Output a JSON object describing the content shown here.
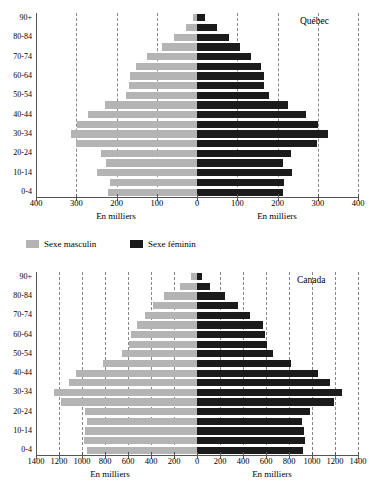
{
  "legend": {
    "items": [
      {
        "label": "Sexe masculin",
        "color": "#b4b4b4",
        "icon": "male-swatch"
      },
      {
        "label": "Sexe féminin",
        "color": "#1b1b1b",
        "icon": "female-swatch"
      }
    ]
  },
  "charts": [
    {
      "id": "quebec",
      "region_label": "Québec",
      "xlabel_left": "En milliers",
      "xlabel_right": "En milliers",
      "ticks": [
        "400",
        "300",
        "200",
        "100",
        "0",
        "100",
        "200",
        "300",
        "400"
      ],
      "age_labels_all": [
        "0-4",
        "5-9",
        "10-14",
        "15-19",
        "20-24",
        "25-29",
        "30-34",
        "35-39",
        "40-44",
        "45-49",
        "50-54",
        "55-59",
        "60-64",
        "65-69",
        "70-74",
        "75-79",
        "80-84",
        "85-89",
        "90+"
      ],
      "age_labels_shown": [
        "90+",
        "80-84",
        "70-74",
        "60-64",
        "50-54",
        "40-44",
        "30-34",
        "20-24",
        "10-14",
        "0-4"
      ],
      "chart_data": {
        "type": "bar",
        "subtype": "population-pyramid",
        "title": "Québec",
        "xlabel": "En milliers",
        "ylabel": "",
        "xlim": [
          -400,
          400
        ],
        "xticks": [
          -400,
          -300,
          -200,
          -100,
          0,
          100,
          200,
          300,
          400
        ],
        "xticklabels": [
          "400",
          "300",
          "200",
          "100",
          "0",
          "100",
          "200",
          "300",
          "400"
        ],
        "grid": true,
        "legend_position": "below-chart",
        "categories": [
          "0-4",
          "5-9",
          "10-14",
          "15-19",
          "20-24",
          "25-29",
          "30-34",
          "35-39",
          "40-44",
          "45-49",
          "50-54",
          "55-59",
          "60-64",
          "65-69",
          "70-74",
          "75-79",
          "80-84",
          "85-89",
          "90+"
        ],
        "series": [
          {
            "name": "Sexe masculin",
            "color": "#b4b4b4",
            "side": "left",
            "values": [
              222,
              217,
              249,
              227,
              239,
              300,
              312,
              297,
              270,
              228,
              176,
              168,
              166,
              152,
              123,
              88,
              56,
              28,
              9
            ]
          },
          {
            "name": "Sexe féminin",
            "color": "#1b1b1b",
            "side": "right",
            "values": [
              213,
              215,
              235,
              213,
              233,
              298,
              325,
              300,
              272,
              226,
              178,
              167,
              166,
              158,
              134,
              108,
              80,
              50,
              20
            ]
          }
        ]
      }
    },
    {
      "id": "canada",
      "region_label": "Canada",
      "xlabel_left": "En milliers",
      "xlabel_right": "En milliers",
      "ticks": [
        "1400",
        "1200",
        "1000",
        "800",
        "600",
        "400",
        "200",
        "0",
        "200",
        "400",
        "600",
        "800",
        "1000",
        "1200",
        "1400"
      ],
      "age_labels_all": [
        "0-4",
        "5-9",
        "10-14",
        "15-19",
        "20-24",
        "25-29",
        "30-34",
        "35-39",
        "40-44",
        "45-49",
        "50-54",
        "55-59",
        "60-64",
        "65-69",
        "70-74",
        "75-79",
        "80-84",
        "85-89",
        "90+"
      ],
      "age_labels_shown": [
        "90+",
        "80-84",
        "70-74",
        "60-64",
        "50-54",
        "40-44",
        "30-34",
        "20-24",
        "10-14",
        "0-4"
      ],
      "chart_data": {
        "type": "bar",
        "subtype": "population-pyramid",
        "title": "Canada",
        "xlabel": "En milliers",
        "ylabel": "",
        "xlim": [
          -1400,
          1400
        ],
        "xticks": [
          -1400,
          -1200,
          -1000,
          -800,
          -600,
          -400,
          -200,
          0,
          200,
          400,
          600,
          800,
          1000,
          1200,
          1400
        ],
        "xticklabels": [
          "1400",
          "1200",
          "1000",
          "800",
          "600",
          "400",
          "200",
          "0",
          "200",
          "400",
          "600",
          "800",
          "1000",
          "1200",
          "1400"
        ],
        "grid": true,
        "legend_position": "above-chart",
        "categories": [
          "0-4",
          "5-9",
          "10-14",
          "15-19",
          "20-24",
          "25-29",
          "30-34",
          "35-39",
          "40-44",
          "45-49",
          "50-54",
          "55-59",
          "60-64",
          "65-69",
          "70-74",
          "75-79",
          "80-84",
          "85-89",
          "90+"
        ],
        "series": [
          {
            "name": "Sexe masculin",
            "color": "#b4b4b4",
            "side": "left",
            "values": [
              960,
              980,
              970,
              960,
              975,
              1185,
              1245,
              1115,
              1055,
              815,
              655,
              595,
              570,
              520,
              450,
              385,
              290,
              150,
              55
            ]
          },
          {
            "name": "Sexe féminin",
            "color": "#1b1b1b",
            "side": "right",
            "values": [
              920,
              935,
              930,
              915,
              985,
              1195,
              1260,
              1155,
              1050,
              815,
              660,
              605,
              595,
              575,
              465,
              360,
              240,
              115,
              45
            ]
          }
        ]
      }
    }
  ]
}
